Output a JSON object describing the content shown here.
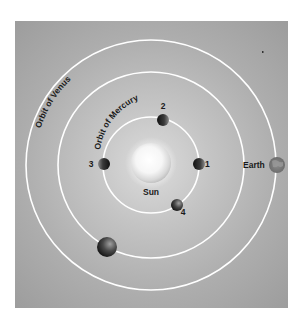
{
  "diagram": {
    "labels": {
      "sun": "Sun",
      "earth": "Earth",
      "orbit_venus": "Orbit of Venus",
      "orbit_mercury": "Orbit of Mercury"
    },
    "mercury_positions": [
      {
        "id": "1",
        "label": "1"
      },
      {
        "id": "2",
        "label": "2"
      },
      {
        "id": "3",
        "label": "3"
      },
      {
        "id": "4",
        "label": "4"
      }
    ],
    "colors": {
      "background": "#a8a8a8",
      "orbit": "#ffffff",
      "planet": "#2a2a2a",
      "text": "#1a1a1a"
    }
  }
}
